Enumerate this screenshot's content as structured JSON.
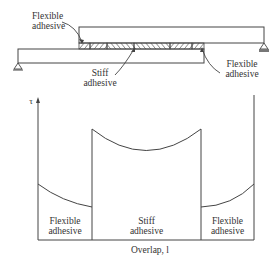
{
  "joint_diagram": {
    "labels": {
      "flexible_top_left": [
        "Flexible",
        "adhesive"
      ],
      "stiff": [
        "Stiff",
        "adhesive"
      ],
      "flexible_bottom_right": [
        "Flexible",
        "adhesive"
      ]
    },
    "segment_markers": [
      "1",
      "2",
      "3"
    ]
  },
  "stress_plot": {
    "y_axis_label": "τ",
    "x_axis_label": "Overlap, l",
    "regions": [
      {
        "line1": "Flexible",
        "line2": "adhesive"
      },
      {
        "line1": "Stiff",
        "line2": "adhesive"
      },
      {
        "line1": "Flexible",
        "line2": "adhesive"
      }
    ]
  },
  "colors": {
    "line": "#444444",
    "background": "#ffffff"
  }
}
